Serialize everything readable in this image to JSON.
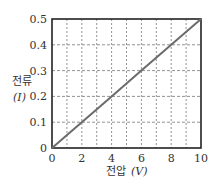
{
  "chart_data": {
    "type": "line",
    "title": "",
    "xlabel": "전압",
    "xlabel_unit": "(V)",
    "ylabel": "전류",
    "ylabel_unit": "(I)",
    "xlim": [
      0,
      10
    ],
    "ylim": [
      0,
      0.5
    ],
    "x_ticks": [
      "0",
      "2",
      "4",
      "6",
      "8",
      "10"
    ],
    "y_ticks": [
      "0",
      "0.1",
      "0.2",
      "0.3",
      "0.4",
      "0.5"
    ],
    "grid": {
      "on": true,
      "style": "dashed",
      "x_step": 1,
      "y_step": 0.1
    },
    "legend": null,
    "series": [
      {
        "name": "I-V",
        "x": [
          0,
          2,
          4,
          6,
          8,
          10
        ],
        "values": [
          0,
          0.1,
          0.2,
          0.3,
          0.4,
          0.5
        ],
        "color": "#6b6b6b"
      }
    ]
  },
  "colors": {
    "frame": "#222222",
    "grid": "#777777",
    "line": "#6b6b6b"
  }
}
